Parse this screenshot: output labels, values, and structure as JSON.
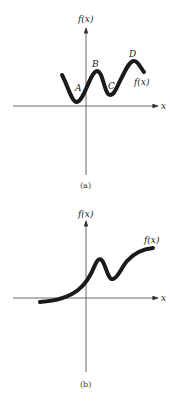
{
  "panels": [
    {
      "id": "a",
      "caption": "(a)",
      "y_axis_label": "f(x)",
      "x_axis_label": "x",
      "curve_label": "f(x)",
      "points": [
        {
          "name": "A",
          "label": "A"
        },
        {
          "name": "B",
          "label": "B"
        },
        {
          "name": "C",
          "label": "C"
        },
        {
          "name": "D",
          "label": "D"
        }
      ]
    },
    {
      "id": "b",
      "caption": "(b)",
      "y_axis_label": "f(x)",
      "x_axis_label": "x",
      "curve_label": "f(x)"
    }
  ],
  "colors": {
    "curve": "#1a1a1a",
    "axis": "#444444"
  }
}
